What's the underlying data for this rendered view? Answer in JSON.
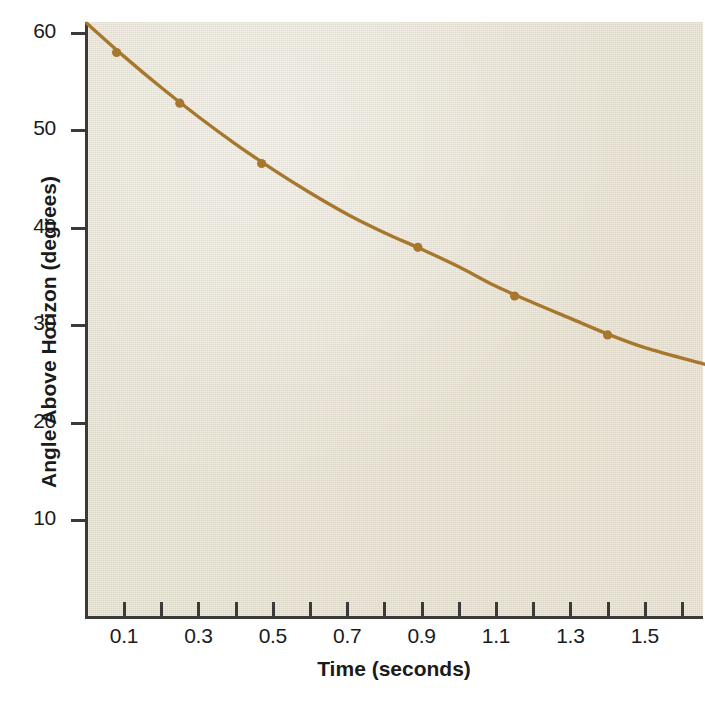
{
  "figure": {
    "background_color": "#eeeade",
    "curve_color": "#a8772e",
    "axis_color": "#3a3a38",
    "text_color": "#1b1b1b"
  },
  "chart_data": {
    "type": "line",
    "title": "",
    "xlabel": "Time (seconds)",
    "ylabel": "Angle Above Horizon (degrees)",
    "xlim": [
      0.0,
      1.66
    ],
    "ylim": [
      0.0,
      62.0
    ],
    "grid": false,
    "legend": "none",
    "x_tick_labels": [
      "0.1",
      "0.3",
      "0.5",
      "0.7",
      "0.9",
      "1.1",
      "1.3",
      "1.5"
    ],
    "x_tick_values": [
      0.1,
      0.3,
      0.5,
      0.7,
      0.9,
      1.1,
      1.3,
      1.5
    ],
    "x_minor_tick_values": [
      0.1,
      0.2,
      0.3,
      0.4,
      0.5,
      0.6,
      0.7,
      0.8,
      0.9,
      1.0,
      1.1,
      1.2,
      1.3,
      1.4,
      1.5,
      1.6
    ],
    "y_tick_labels": [
      "60",
      "50",
      "40",
      "30",
      "20",
      "10"
    ],
    "y_tick_values": [
      60,
      50,
      40,
      30,
      20,
      10
    ],
    "series": [
      {
        "name": "Angle above horizon",
        "marker": "filled-circle",
        "color": "#a8772e",
        "points": [
          {
            "x": 0.08,
            "y": 58.0
          },
          {
            "x": 0.25,
            "y": 52.8
          },
          {
            "x": 0.47,
            "y": 46.6
          },
          {
            "x": 0.89,
            "y": 38.0
          },
          {
            "x": 1.15,
            "y": 33.0
          },
          {
            "x": 1.4,
            "y": 29.0
          }
        ],
        "fitted_curve": [
          {
            "x": 0.0,
            "y": 61.0
          },
          {
            "x": 0.1,
            "y": 57.6
          },
          {
            "x": 0.2,
            "y": 54.4
          },
          {
            "x": 0.3,
            "y": 51.4
          },
          {
            "x": 0.4,
            "y": 48.6
          },
          {
            "x": 0.5,
            "y": 46.0
          },
          {
            "x": 0.6,
            "y": 43.6
          },
          {
            "x": 0.7,
            "y": 41.4
          },
          {
            "x": 0.8,
            "y": 39.5
          },
          {
            "x": 0.9,
            "y": 37.8
          },
          {
            "x": 1.0,
            "y": 36.0
          },
          {
            "x": 1.1,
            "y": 34.0
          },
          {
            "x": 1.2,
            "y": 32.3
          },
          {
            "x": 1.3,
            "y": 30.7
          },
          {
            "x": 1.4,
            "y": 29.1
          },
          {
            "x": 1.5,
            "y": 27.7
          },
          {
            "x": 1.66,
            "y": 26.0
          }
        ]
      }
    ]
  }
}
